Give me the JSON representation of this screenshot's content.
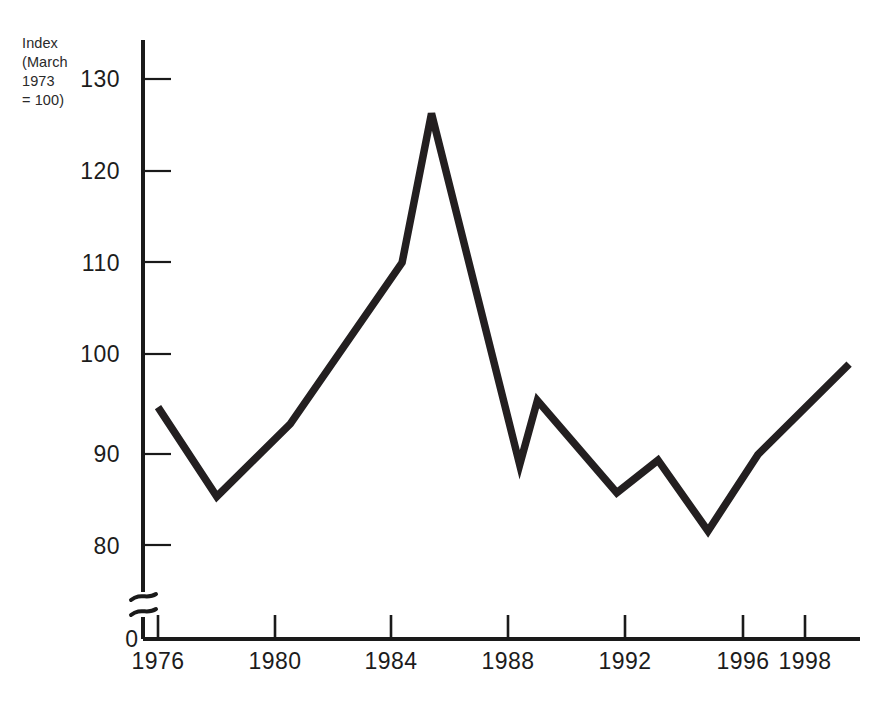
{
  "figure": {
    "background_color": "#ffffff",
    "line_color": "#231f20",
    "axis_color": "#1a1a1a"
  },
  "axis_caption": {
    "line1": "Index",
    "line2": "(March",
    "line3": "1973",
    "line4": "= 100)",
    "full": "Index\n(March\n1973\n= 100)"
  },
  "y_axis": {
    "ticks": [
      "130",
      "120",
      "110",
      "100",
      "90",
      "80"
    ],
    "zero_label": "0",
    "has_axis_break": true
  },
  "x_axis": {
    "ticks": [
      "1976",
      "1980",
      "1984",
      "1988",
      "1992",
      "1996",
      "1998"
    ]
  },
  "chart_data": {
    "type": "line",
    "title": "",
    "subtitle": "",
    "xlabel": "",
    "ylabel": "Index (March 1973 = 100)",
    "grid": false,
    "legend": null,
    "axis_break": true,
    "xlim": [
      1975.5,
      1999.6
    ],
    "ylim": [
      78,
      132
    ],
    "y_ticks": [
      80,
      90,
      100,
      110,
      120,
      130
    ],
    "x_ticks": [
      1976,
      1980,
      1984,
      1988,
      1992,
      1996,
      1998
    ],
    "series": [
      {
        "name": "Sterling effective exchange rate index",
        "x": [
          1976.0,
          1978.0,
          1980.5,
          1984.3,
          1985.3,
          1988.3,
          1988.9,
          1991.6,
          1993.0,
          1994.7,
          1996.4,
          1999.5
        ],
        "values": [
          94.8,
          85.2,
          93.0,
          110.3,
          126.3,
          88.6,
          95.5,
          85.6,
          89.1,
          81.5,
          89.7,
          99.4
        ]
      }
    ]
  }
}
